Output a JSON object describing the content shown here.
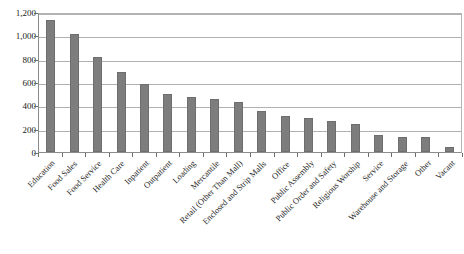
{
  "chart_data": {
    "type": "bar",
    "title": "",
    "subtitle": "",
    "xlabel": "",
    "ylabel": "",
    "ylim": [
      0,
      1200
    ],
    "yticks": [
      0,
      200,
      400,
      600,
      800,
      1000,
      1200
    ],
    "ytick_labels": [
      "0",
      "200",
      "400",
      "600",
      "800",
      "1,000",
      "1,200"
    ],
    "grid": true,
    "legend": false,
    "legend_position": "none",
    "bar_color": "#7d7d7d",
    "categories": [
      "Education",
      "Food Sales",
      "Food Service",
      "Health Care",
      "Inpatient",
      "Outpatient",
      "Loading",
      "Mercantile",
      "Retail (Other Than Mall)",
      "Enclosed and Strip Malls",
      "Office",
      "Public Assembly",
      "Public Order and Safety",
      "Religious Worship",
      "Service",
      "Warehouse and Storage",
      "Other",
      "Vacant"
    ],
    "values": [
      1130,
      1010,
      815,
      690,
      580,
      495,
      470,
      455,
      425,
      355,
      310,
      290,
      270,
      240,
      150,
      130,
      125,
      40
    ]
  }
}
